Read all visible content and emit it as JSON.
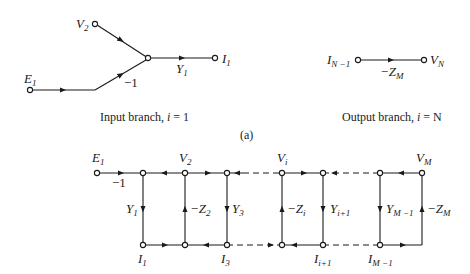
{
  "figure_label": "(a)",
  "input_branch": {
    "caption_text": "Input branch, ",
    "caption_var": "i",
    "caption_eq": " = 1",
    "nodes": {
      "v2": {
        "main": "V",
        "sub": "2"
      },
      "e1": {
        "main": "E",
        "sub": "1"
      },
      "i1": {
        "main": "I",
        "sub": "1"
      }
    },
    "edges": {
      "minus_one": "−1",
      "y1": {
        "main": "Y",
        "sub": "1"
      }
    }
  },
  "output_branch": {
    "caption_text": "Output branch, ",
    "caption_var": "i",
    "caption_eq": " = N",
    "nodes": {
      "in": {
        "main": "I",
        "sub": "N −1"
      },
      "out": {
        "main": "V",
        "sub": "N"
      }
    },
    "edges": {
      "zm": {
        "main": "−Z",
        "sub": "M"
      }
    }
  },
  "ladder": {
    "top_nodes": {
      "e1": {
        "main": "E",
        "sub": "1"
      },
      "v2": {
        "main": "V",
        "sub": "2"
      },
      "vi": {
        "main": "V",
        "sub": "i"
      },
      "vm": {
        "main": "V",
        "sub": "M"
      }
    },
    "bottom_nodes": {
      "i1": {
        "main": "I",
        "sub": "1"
      },
      "i3": {
        "main": "I",
        "sub": "3"
      },
      "ii1": {
        "main": "I",
        "sub": "i+1"
      },
      "im1": {
        "main": "I",
        "sub": "M −1"
      }
    },
    "edges": {
      "minus_one": "−1",
      "y1": {
        "main": "Y",
        "sub": "1"
      },
      "z2": {
        "main": "−Z",
        "sub": "2"
      },
      "y3": {
        "main": "Y",
        "sub": "3"
      },
      "zi": {
        "main": "−Z",
        "sub": "i"
      },
      "yi1": {
        "main": "Y",
        "sub": "i+1"
      },
      "ym1": {
        "main": "Y",
        "sub": "M −1"
      },
      "zm": {
        "main": "−Z",
        "sub": "M"
      }
    }
  }
}
